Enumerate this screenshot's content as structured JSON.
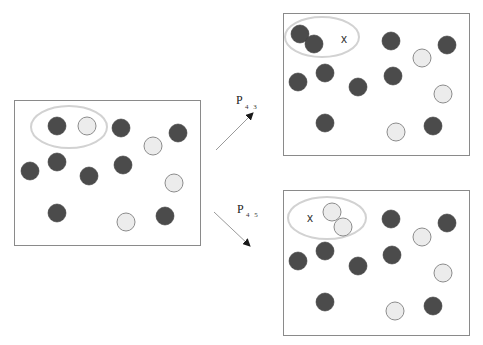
{
  "colors": {
    "dark_particle": "#4b4b4b",
    "light_particle": "#ececec",
    "light_particle_stroke": "#8c8c8c",
    "ellipse_stroke": "#d2d2d2",
    "box_stroke": "#8a8a8a",
    "arrow": "#9a9a9a"
  },
  "panels": [
    {
      "id": "initial",
      "box": {
        "x": 14,
        "y": 100,
        "w": 186,
        "h": 145
      },
      "ellipse": {
        "cx": 69,
        "cy": 127,
        "rx": 38,
        "ry": 21
      },
      "marker": null,
      "particles": [
        {
          "x": 57,
          "y": 126,
          "type": "dark"
        },
        {
          "x": 87,
          "y": 126,
          "type": "light"
        },
        {
          "x": 121,
          "y": 128,
          "type": "dark"
        },
        {
          "x": 153,
          "y": 146,
          "type": "light"
        },
        {
          "x": 178,
          "y": 133,
          "type": "dark"
        },
        {
          "x": 30,
          "y": 171,
          "type": "dark"
        },
        {
          "x": 57,
          "y": 162,
          "type": "dark"
        },
        {
          "x": 89,
          "y": 176,
          "type": "dark"
        },
        {
          "x": 123,
          "y": 165,
          "type": "dark"
        },
        {
          "x": 174,
          "y": 183,
          "type": "light"
        },
        {
          "x": 57,
          "y": 213,
          "type": "dark"
        },
        {
          "x": 126,
          "y": 222,
          "type": "light"
        },
        {
          "x": 165,
          "y": 216,
          "type": "dark"
        }
      ]
    },
    {
      "id": "transition-43",
      "box": {
        "x": 283,
        "y": 13,
        "w": 186,
        "h": 142
      },
      "ellipse": {
        "cx": 322,
        "cy": 37,
        "rx": 37,
        "ry": 20
      },
      "marker": {
        "x": 344,
        "y": 43,
        "text": "x"
      },
      "particles": [
        {
          "x": 300,
          "y": 34,
          "type": "dark"
        },
        {
          "x": 314,
          "y": 44,
          "type": "dark"
        },
        {
          "x": 391,
          "y": 41,
          "type": "dark"
        },
        {
          "x": 422,
          "y": 58,
          "type": "light"
        },
        {
          "x": 447,
          "y": 45,
          "type": "dark"
        },
        {
          "x": 298,
          "y": 82,
          "type": "dark"
        },
        {
          "x": 325,
          "y": 73,
          "type": "dark"
        },
        {
          "x": 358,
          "y": 87,
          "type": "dark"
        },
        {
          "x": 393,
          "y": 76,
          "type": "dark"
        },
        {
          "x": 443,
          "y": 94,
          "type": "light"
        },
        {
          "x": 325,
          "y": 123,
          "type": "dark"
        },
        {
          "x": 396,
          "y": 132,
          "type": "light"
        },
        {
          "x": 433,
          "y": 126,
          "type": "dark"
        }
      ]
    },
    {
      "id": "transition-45",
      "box": {
        "x": 283,
        "y": 190,
        "w": 186,
        "h": 145
      },
      "ellipse": {
        "cx": 327,
        "cy": 218,
        "rx": 39,
        "ry": 21
      },
      "marker": {
        "x": 310,
        "y": 222,
        "text": "x"
      },
      "particles": [
        {
          "x": 332,
          "y": 212,
          "type": "light"
        },
        {
          "x": 343,
          "y": 227,
          "type": "light"
        },
        {
          "x": 391,
          "y": 219,
          "type": "dark"
        },
        {
          "x": 422,
          "y": 237,
          "type": "light"
        },
        {
          "x": 447,
          "y": 223,
          "type": "dark"
        },
        {
          "x": 298,
          "y": 261,
          "type": "dark"
        },
        {
          "x": 325,
          "y": 251,
          "type": "dark"
        },
        {
          "x": 358,
          "y": 266,
          "type": "dark"
        },
        {
          "x": 392,
          "y": 255,
          "type": "dark"
        },
        {
          "x": 443,
          "y": 273,
          "type": "light"
        },
        {
          "x": 325,
          "y": 302,
          "type": "dark"
        },
        {
          "x": 395,
          "y": 311,
          "type": "light"
        },
        {
          "x": 433,
          "y": 306,
          "type": "dark"
        }
      ]
    }
  ],
  "particle_radius": 9,
  "arrows": [
    {
      "id": "arrow-p43",
      "x1": 216,
      "y1": 150,
      "x2": 253,
      "y2": 113,
      "label": "P",
      "subscript": "43",
      "label_x": 236,
      "label_y": 104,
      "sub_x": 245,
      "sub_y": 109
    },
    {
      "id": "arrow-p45",
      "x1": 214,
      "y1": 212,
      "x2": 250,
      "y2": 246,
      "label": "P",
      "subscript": "45",
      "label_x": 237,
      "label_y": 213,
      "sub_x": 246,
      "sub_y": 217
    }
  ]
}
